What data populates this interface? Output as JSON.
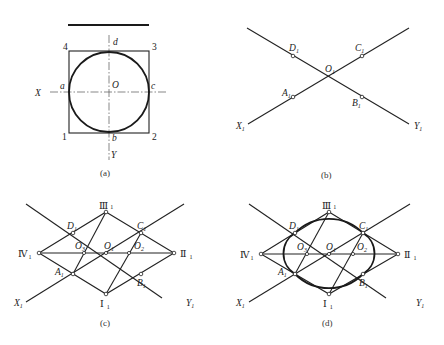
{
  "figure": {
    "panel_a": {
      "caption": "(a)",
      "labels": {
        "corner_4": "4",
        "corner_3": "3",
        "corner_1": "1",
        "corner_2": "2",
        "d": "d",
        "a": "a",
        "c": "c",
        "b": "b",
        "O": "O",
        "X": "X",
        "Y": "Y"
      }
    },
    "panel_b": {
      "caption": "(b)",
      "labels": {
        "D": "D",
        "C": "C",
        "A": "A",
        "B": "B",
        "O": "O",
        "X": "X",
        "Y": "Y",
        "sub": "1"
      }
    },
    "panel_c": {
      "caption": "(c)",
      "labels": {
        "III": "Ⅲ",
        "II": "Ⅱ",
        "I": "Ⅰ",
        "IV": "Ⅳ",
        "D": "D",
        "C": "C",
        "A": "A",
        "B": "B",
        "O1": "O",
        "O2": "O",
        "O3": "O",
        "X": "X",
        "Y": "Y",
        "sub1": "1",
        "sub2": "2",
        "sub3": "3"
      }
    },
    "panel_d": {
      "caption": "(d)",
      "labels": {
        "III": "Ⅲ",
        "II": "Ⅱ",
        "I": "Ⅰ",
        "IV": "Ⅳ",
        "D": "D",
        "C": "C",
        "A": "A",
        "B": "B",
        "O1": "O",
        "O2": "O",
        "O3": "O",
        "X": "X",
        "Y": "Y",
        "sub1": "1",
        "sub2": "2",
        "sub3": "3"
      }
    }
  }
}
